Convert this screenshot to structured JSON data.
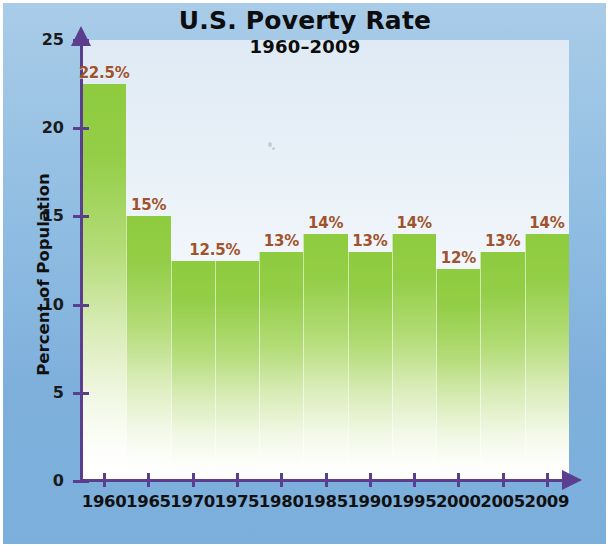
{
  "chart_data": {
    "type": "bar",
    "title": "U.S. Poverty Rate",
    "subtitle": "1960–2009",
    "xlabel": "",
    "ylabel": "Percent of Population",
    "ylim": [
      0,
      25
    ],
    "yticks": [
      0,
      5,
      10,
      15,
      20,
      25
    ],
    "ytick_labels": [
      "0",
      "5",
      "10",
      "15",
      "20",
      "25"
    ],
    "grid": false,
    "legend": "none",
    "categories": [
      "1960",
      "1965",
      "1970",
      "1975",
      "1980",
      "1985",
      "1990",
      "1995",
      "2000",
      "2005",
      "2009"
    ],
    "values": [
      22.5,
      15,
      12.5,
      12.5,
      13,
      14,
      13,
      14,
      12,
      13,
      14
    ],
    "value_labels": [
      "22.5%",
      "15%",
      "12.5%",
      "",
      "13%",
      "14%",
      "13%",
      "14%",
      "12%",
      "13%",
      "14%"
    ],
    "bar_color": "#8ecb3e",
    "label_color": "#a0522d",
    "axis_color": "#5b3e8e",
    "background_color": "#7fb0dc",
    "plot_background_color": "#e9f1f8"
  }
}
